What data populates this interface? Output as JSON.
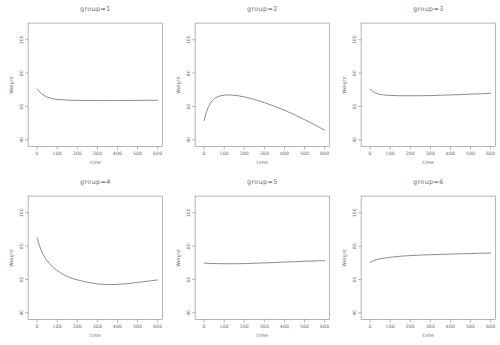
{
  "page": {
    "background_color": "#ffffff",
    "text_color": "#6e6e6e",
    "line_color": "#5a5a5a"
  },
  "chart_data": [
    {
      "type": "line",
      "title": "group=1",
      "xlabel": "time",
      "ylabel": "Weight",
      "xlim": [
        -45,
        625
      ],
      "ylim": [
        36,
        110
      ],
      "xticks": [
        0,
        100,
        200,
        300,
        400,
        500,
        600
      ],
      "yticks": [
        40,
        60,
        80,
        100
      ],
      "grid": false,
      "legend": "none",
      "series": [
        {
          "name": "weight-curve",
          "x": [
            0,
            10,
            20,
            30,
            40,
            50,
            75,
            100,
            150,
            200,
            250,
            300,
            350,
            400,
            450,
            500,
            550,
            600
          ],
          "y": [
            70.5,
            69.0,
            67.8,
            66.9,
            66.2,
            65.6,
            64.7,
            64.2,
            63.8,
            63.6,
            63.5,
            63.5,
            63.5,
            63.5,
            63.6,
            63.6,
            63.7,
            63.7
          ]
        }
      ]
    },
    {
      "type": "line",
      "title": "group=2",
      "xlabel": "time",
      "ylabel": "Weight",
      "xlim": [
        -45,
        625
      ],
      "ylim": [
        36,
        110
      ],
      "xticks": [
        0,
        100,
        200,
        300,
        400,
        500,
        600
      ],
      "yticks": [
        40,
        60,
        80,
        100
      ],
      "grid": false,
      "legend": "none",
      "series": [
        {
          "name": "weight-curve",
          "x": [
            0,
            10,
            20,
            30,
            40,
            50,
            65,
            80,
            100,
            125,
            150,
            175,
            200,
            250,
            300,
            350,
            400,
            450,
            500,
            550,
            600
          ],
          "y": [
            51.5,
            56.0,
            59.3,
            61.7,
            63.4,
            64.6,
            65.7,
            66.3,
            66.7,
            66.9,
            66.7,
            66.3,
            65.7,
            64.2,
            62.3,
            60.1,
            57.7,
            55.0,
            52.1,
            49.0,
            45.8
          ]
        }
      ]
    },
    {
      "type": "line",
      "title": "group=3",
      "xlabel": "time",
      "ylabel": "Weight",
      "xlim": [
        -45,
        625
      ],
      "ylim": [
        36,
        110
      ],
      "xticks": [
        0,
        100,
        200,
        300,
        400,
        500,
        600
      ],
      "yticks": [
        40,
        60,
        80,
        100
      ],
      "grid": false,
      "legend": "none",
      "series": [
        {
          "name": "weight-curve",
          "x": [
            0,
            10,
            20,
            30,
            40,
            50,
            75,
            100,
            150,
            200,
            250,
            300,
            350,
            400,
            450,
            500,
            550,
            600
          ],
          "y": [
            70.5,
            69.3,
            68.5,
            67.9,
            67.5,
            67.2,
            66.8,
            66.6,
            66.4,
            66.4,
            66.4,
            66.5,
            66.7,
            66.9,
            67.1,
            67.4,
            67.6,
            67.9
          ]
        }
      ]
    },
    {
      "type": "line",
      "title": "group=4",
      "xlabel": "time",
      "ylabel": "Weight",
      "xlim": [
        -45,
        625
      ],
      "ylim": [
        36,
        110
      ],
      "xticks": [
        0,
        100,
        200,
        300,
        400,
        500,
        600
      ],
      "yticks": [
        40,
        60,
        80,
        100
      ],
      "grid": false,
      "legend": "none",
      "series": [
        {
          "name": "weight-curve",
          "x": [
            0,
            10,
            20,
            30,
            40,
            50,
            75,
            100,
            125,
            150,
            175,
            200,
            250,
            300,
            350,
            400,
            450,
            500,
            550,
            600
          ],
          "y": [
            85.0,
            80.8,
            77.6,
            75.0,
            72.9,
            71.1,
            67.7,
            65.2,
            63.3,
            61.8,
            60.6,
            59.7,
            58.3,
            57.3,
            56.9,
            57.0,
            57.5,
            58.2,
            58.9,
            59.7
          ]
        }
      ]
    },
    {
      "type": "line",
      "title": "group=5",
      "xlabel": "time",
      "ylabel": "Weight",
      "xlim": [
        -45,
        625
      ],
      "ylim": [
        36,
        110
      ],
      "xticks": [
        0,
        100,
        200,
        300,
        400,
        500,
        600
      ],
      "yticks": [
        40,
        60,
        80,
        100
      ],
      "grid": false,
      "legend": "none",
      "series": [
        {
          "name": "weight-curve",
          "x": [
            0,
            50,
            100,
            150,
            200,
            250,
            300,
            350,
            400,
            450,
            500,
            550,
            600
          ],
          "y": [
            69.8,
            69.5,
            69.4,
            69.4,
            69.5,
            69.7,
            69.9,
            70.1,
            70.4,
            70.6,
            70.9,
            71.1,
            71.3
          ]
        }
      ]
    },
    {
      "type": "line",
      "title": "group=6",
      "xlabel": "time",
      "ylabel": "Weight",
      "xlim": [
        -45,
        625
      ],
      "ylim": [
        36,
        110
      ],
      "xticks": [
        0,
        100,
        200,
        300,
        400,
        500,
        600
      ],
      "yticks": [
        40,
        60,
        80,
        100
      ],
      "grid": false,
      "legend": "none",
      "series": [
        {
          "name": "weight-curve",
          "x": [
            0,
            10,
            20,
            30,
            40,
            50,
            75,
            100,
            150,
            200,
            250,
            300,
            350,
            400,
            450,
            500,
            550,
            600
          ],
          "y": [
            70.2,
            70.9,
            71.4,
            71.8,
            72.1,
            72.4,
            72.9,
            73.3,
            73.9,
            74.3,
            74.6,
            74.8,
            75.0,
            75.2,
            75.4,
            75.5,
            75.7,
            75.8
          ]
        }
      ]
    }
  ]
}
